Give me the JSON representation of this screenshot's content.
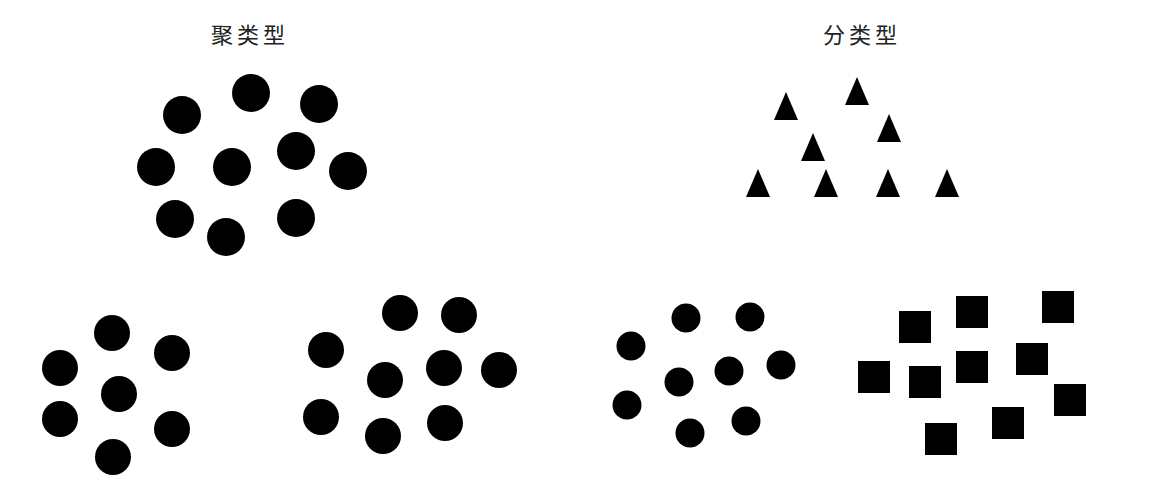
{
  "labels": {
    "clustering": "聚类型",
    "classification": "分类型"
  },
  "colors": {
    "shape": "#000000",
    "background": "#ffffff",
    "text": "#222222"
  },
  "groups": {
    "top_left_circles": {
      "shape": "circle",
      "r": 19,
      "points": [
        [
          182,
          115
        ],
        [
          251,
          93
        ],
        [
          319,
          104
        ],
        [
          156,
          167
        ],
        [
          232,
          167
        ],
        [
          296,
          151
        ],
        [
          348,
          171
        ],
        [
          175,
          219
        ],
        [
          226,
          237
        ],
        [
          296,
          218
        ]
      ]
    },
    "top_right_triangles": {
      "shape": "triangle",
      "w": 24,
      "h": 28,
      "points": [
        [
          786,
          106
        ],
        [
          857,
          91
        ],
        [
          889,
          128
        ],
        [
          813,
          147
        ],
        [
          758,
          183
        ],
        [
          826,
          183
        ],
        [
          888,
          183
        ],
        [
          947,
          183
        ]
      ]
    },
    "bottom_left_circles_a": {
      "shape": "circle",
      "r": 18,
      "points": [
        [
          112,
          333
        ],
        [
          172,
          353
        ],
        [
          60,
          368
        ],
        [
          119,
          394
        ],
        [
          60,
          419
        ],
        [
          172,
          429
        ],
        [
          113,
          457
        ]
      ]
    },
    "bottom_left_circles_b": {
      "shape": "circle",
      "r": 18,
      "points": [
        [
          400,
          313
        ],
        [
          459,
          315
        ],
        [
          326,
          350
        ],
        [
          385,
          380
        ],
        [
          444,
          368
        ],
        [
          499,
          370
        ],
        [
          321,
          417
        ],
        [
          383,
          436
        ],
        [
          445,
          423
        ]
      ]
    },
    "bottom_right_circles": {
      "shape": "circle",
      "r": 14.5,
      "points": [
        [
          686,
          318
        ],
        [
          750,
          317
        ],
        [
          631,
          346
        ],
        [
          781,
          365
        ],
        [
          729,
          371
        ],
        [
          679,
          382
        ],
        [
          627,
          405
        ],
        [
          746,
          421
        ],
        [
          690,
          433
        ]
      ]
    },
    "bottom_right_squares": {
      "shape": "square",
      "size": 32,
      "points": [
        [
          915,
          327
        ],
        [
          972,
          312
        ],
        [
          1058,
          307
        ],
        [
          874,
          377
        ],
        [
          925,
          382
        ],
        [
          972,
          367
        ],
        [
          1032,
          359
        ],
        [
          1070,
          400
        ],
        [
          1008,
          423
        ],
        [
          941,
          439
        ]
      ]
    }
  }
}
